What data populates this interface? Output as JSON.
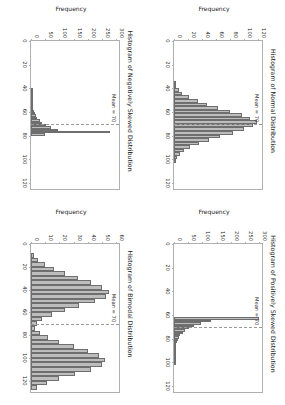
{
  "figure": {
    "background_color": "#ffffff",
    "bar_face_color": "#bdbdbd",
    "bar_edge_color": "#6e6e6e",
    "mean_line_color": "#9a9a9a",
    "axis_color": "#b0b0b0",
    "rows": 2,
    "cols": 2
  },
  "chart_data": [
    {
      "type": "bar",
      "id": "normal",
      "title": "Histogram of Normal Distribution",
      "xlabel": "",
      "ylabel": "Frequency",
      "xlim": [
        0,
        125
      ],
      "ylim": [
        0,
        125
      ],
      "xticks": [
        0,
        20,
        40,
        60,
        80,
        100,
        120
      ],
      "xticklabels": [
        "0",
        "20",
        "40",
        "60",
        "80",
        "100",
        "120"
      ],
      "yticks": [
        0,
        20,
        40,
        60,
        80,
        100,
        120
      ],
      "yticklabels": [
        "0",
        "20",
        "40",
        "60",
        "80",
        "100",
        "120"
      ],
      "grid": false,
      "annotation": {
        "text": "Mean = 70",
        "x": 70
      },
      "bin_edges": [
        34,
        37,
        40,
        43,
        46,
        49,
        52,
        55,
        58,
        61,
        64,
        67,
        70,
        73,
        76,
        79,
        82,
        85,
        88,
        91,
        94,
        97,
        100,
        103
      ],
      "bin_centers": [
        35.5,
        38.5,
        41.5,
        44.5,
        47.5,
        50.5,
        53.5,
        56.5,
        59.5,
        62.5,
        65.5,
        68.5,
        71.5,
        74.5,
        77.5,
        80.5,
        83.5,
        86.5,
        89.5,
        92.5,
        95.5,
        98.5,
        101.5
      ],
      "values": [
        2,
        3,
        7,
        12,
        22,
        34,
        47,
        63,
        80,
        97,
        108,
        118,
        112,
        99,
        84,
        66,
        50,
        36,
        23,
        14,
        8,
        4,
        2
      ]
    },
    {
      "type": "bar",
      "id": "positively-skewed",
      "title": "Histogram of Positively Skewed Distribution",
      "xlabel": "",
      "ylabel": "Frequency",
      "xlim": [
        0,
        125
      ],
      "ylim": [
        0,
        310
      ],
      "xticks": [
        0,
        20,
        40,
        60,
        80,
        100,
        120
      ],
      "xticklabels": [
        "0",
        "20",
        "40",
        "60",
        "80",
        "100",
        "120"
      ],
      "yticks": [
        0,
        50,
        100,
        150,
        200,
        250,
        300
      ],
      "yticklabels": [
        "0",
        "50",
        "100",
        "150",
        "200",
        "250",
        "300"
      ],
      "grid": false,
      "annotation": {
        "text": "Mean = 70",
        "x": 70
      },
      "bin_edges": [
        62,
        64,
        66,
        68,
        70,
        72,
        74,
        76,
        78,
        80,
        82,
        84,
        86,
        88,
        90,
        92,
        94,
        96,
        98,
        100,
        102
      ],
      "bin_centers": [
        63,
        65,
        67,
        69,
        71,
        73,
        75,
        77,
        79,
        81,
        83,
        85,
        87,
        89,
        91,
        93,
        95,
        97,
        99,
        101
      ],
      "values": [
        300,
        130,
        95,
        70,
        52,
        40,
        30,
        22,
        17,
        13,
        10,
        8,
        6,
        5,
        4,
        3,
        2,
        2,
        1,
        1
      ]
    },
    {
      "type": "bar",
      "id": "negatively-skewed",
      "title": "Histogram of Negatively Skewed Distribution",
      "xlabel": "",
      "ylabel": "Frequency",
      "xlim": [
        0,
        125
      ],
      "ylim": [
        0,
        310
      ],
      "xticks": [
        0,
        20,
        40,
        60,
        80,
        100,
        120
      ],
      "xticklabels": [
        "0",
        "20",
        "40",
        "60",
        "80",
        "100",
        "120"
      ],
      "yticks": [
        0,
        50,
        100,
        150,
        200,
        250,
        300
      ],
      "yticklabels": [
        "0",
        "50",
        "100",
        "150",
        "200",
        "250",
        "300"
      ],
      "grid": false,
      "annotation": {
        "text": "Mean = 70",
        "x": 70
      },
      "bin_edges": [
        40,
        42,
        44,
        46,
        48,
        50,
        52,
        54,
        56,
        58,
        60,
        62,
        64,
        66,
        68,
        70,
        72,
        74,
        76,
        78,
        80
      ],
      "bin_centers": [
        41,
        43,
        45,
        47,
        49,
        51,
        53,
        55,
        57,
        59,
        61,
        63,
        65,
        67,
        69,
        71,
        73,
        75,
        77,
        79
      ],
      "values": [
        1,
        1,
        2,
        2,
        3,
        4,
        5,
        6,
        8,
        10,
        13,
        17,
        22,
        30,
        40,
        52,
        70,
        95,
        280,
        48
      ]
    },
    {
      "type": "bar",
      "id": "bimodal",
      "title": "Histogram of Bimodal Distribution",
      "xlabel": "",
      "ylabel": "Frequency",
      "xlim": [
        0,
        130
      ],
      "ylim": [
        0,
        62
      ],
      "xticks": [
        0,
        20,
        40,
        60,
        80,
        100,
        120
      ],
      "xticklabels": [
        "0",
        "20",
        "40",
        "60",
        "80",
        "100",
        "120"
      ],
      "yticks": [
        0,
        10,
        20,
        30,
        40,
        50,
        60
      ],
      "yticklabels": [
        "0",
        "10",
        "20",
        "30",
        "40",
        "50",
        "60"
      ],
      "grid": false,
      "annotation": {
        "text": "Mean = 70",
        "x": 70
      },
      "bin_edges": [
        8,
        12,
        16,
        20,
        24,
        28,
        32,
        36,
        40,
        44,
        48,
        52,
        56,
        60,
        64,
        68,
        72,
        76,
        80,
        84,
        88,
        92,
        96,
        100,
        104,
        108,
        112,
        116,
        120,
        124,
        128
      ],
      "bin_centers": [
        10,
        14,
        18,
        22,
        26,
        30,
        34,
        38,
        42,
        46,
        50,
        54,
        58,
        62,
        66,
        70,
        74,
        78,
        82,
        86,
        90,
        94,
        98,
        102,
        106,
        110,
        114,
        118,
        122,
        126
      ],
      "values": [
        2,
        5,
        10,
        16,
        24,
        33,
        42,
        50,
        55,
        53,
        45,
        34,
        24,
        15,
        8,
        4,
        3,
        6,
        12,
        20,
        30,
        40,
        48,
        52,
        50,
        42,
        31,
        20,
        11,
        4
      ]
    }
  ]
}
